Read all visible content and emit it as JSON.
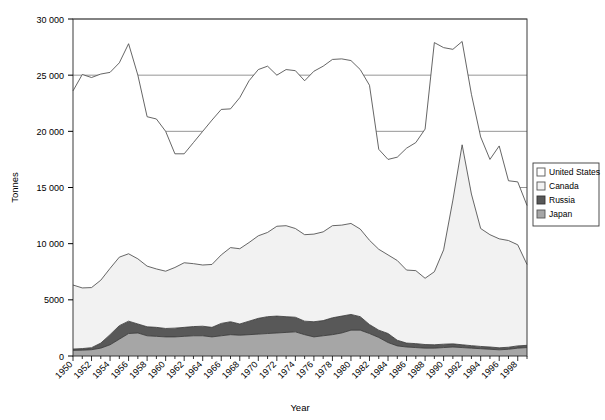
{
  "chart_data": {
    "type": "area",
    "title": "",
    "subtitle": "",
    "xlabel": "Year",
    "ylabel": "Tonnes",
    "stacked": true,
    "grid": true,
    "legend_position": "right",
    "xlim": [
      1950,
      1999
    ],
    "ylim": [
      0,
      30000
    ],
    "ytick_values": [
      0,
      5000,
      10000,
      15000,
      20000,
      25000,
      30000
    ],
    "ytick_labels": [
      "0",
      "5000",
      "10 000",
      "15 000",
      "20 000",
      "25 000",
      "30 000"
    ],
    "x": [
      1950,
      1951,
      1952,
      1953,
      1954,
      1955,
      1956,
      1957,
      1958,
      1959,
      1960,
      1961,
      1962,
      1963,
      1964,
      1965,
      1966,
      1967,
      1968,
      1969,
      1970,
      1971,
      1972,
      1973,
      1974,
      1975,
      1976,
      1977,
      1978,
      1979,
      1980,
      1981,
      1982,
      1983,
      1984,
      1985,
      1986,
      1987,
      1988,
      1989,
      1990,
      1991,
      1992,
      1993,
      1994,
      1995,
      1996,
      1997,
      1998,
      1999
    ],
    "xtick_labels": [
      "1950",
      "1952",
      "1954",
      "1956",
      "1958",
      "1960",
      "1962",
      "1964",
      "1966",
      "1968",
      "1970",
      "1972",
      "1974",
      "1976",
      "1978",
      "1980",
      "1982",
      "1984",
      "1986",
      "1988",
      "1990",
      "1992",
      "1994",
      "1996",
      "1998"
    ],
    "series": [
      {
        "name": "Japan",
        "color": "#a6a6a6",
        "values": [
          500,
          520,
          560,
          700,
          1000,
          1500,
          2000,
          2050,
          1800,
          1750,
          1700,
          1700,
          1750,
          1800,
          1800,
          1700,
          1800,
          1900,
          1850,
          1900,
          1950,
          2000,
          2050,
          2100,
          2150,
          1900,
          1700,
          1800,
          1900,
          2050,
          2300,
          2300,
          2000,
          1650,
          1200,
          900,
          800,
          750,
          700,
          700,
          750,
          800,
          750,
          700,
          650,
          600,
          550,
          600,
          700,
          750
        ]
      },
      {
        "name": "Russia",
        "color": "#585858",
        "values": [
          120,
          140,
          180,
          450,
          900,
          1200,
          1100,
          800,
          800,
          800,
          750,
          780,
          800,
          820,
          850,
          850,
          1100,
          1150,
          1000,
          1200,
          1400,
          1500,
          1500,
          1400,
          1300,
          1200,
          1350,
          1350,
          1500,
          1500,
          1400,
          1200,
          800,
          650,
          800,
          500,
          350,
          350,
          320,
          300,
          300,
          280,
          250,
          220,
          200,
          200,
          180,
          180,
          200,
          200
        ]
      },
      {
        "name": "Canada",
        "color": "#f2f2f2",
        "values": [
          5700,
          5400,
          5350,
          5600,
          5900,
          6100,
          6000,
          5800,
          5400,
          5200,
          5100,
          5400,
          5750,
          5600,
          5450,
          5600,
          6100,
          6600,
          6700,
          7000,
          7350,
          7500,
          8000,
          8100,
          7900,
          7700,
          7800,
          7900,
          8200,
          8100,
          8100,
          7800,
          7500,
          7200,
          7000,
          7100,
          6500,
          6500,
          5900,
          6500,
          8400,
          12800,
          17800,
          13500,
          10500,
          10000,
          9700,
          9500,
          9000,
          7200
        ]
      },
      {
        "name": "United States",
        "color": "#ffffff",
        "values": [
          17280,
          19000,
          18700,
          18350,
          17450,
          17300,
          18700,
          16350,
          13300,
          13350,
          12450,
          10120,
          9700,
          10780,
          11900,
          12850,
          12950,
          12350,
          13450,
          14400,
          14800,
          14800,
          13450,
          13900,
          14050,
          13700,
          14500,
          14750,
          14800,
          14800,
          14500,
          14200,
          13800,
          8900,
          8500,
          9200,
          10850,
          11400,
          13280,
          20400,
          18000,
          13420,
          9200,
          8880,
          8150,
          6700,
          8270,
          5320,
          5600,
          5250
        ]
      }
    ],
    "totals_note": "Stacked cumulative totals: United States top line ranges ~17500 to ~28400"
  },
  "legend": {
    "items": [
      {
        "label": "United States",
        "color": "#ffffff",
        "border": "#555555"
      },
      {
        "label": "Canada",
        "color": "#f2f2f2",
        "border": "#555555"
      },
      {
        "label": "Russia",
        "color": "#585858",
        "border": "#333333"
      },
      {
        "label": "Japan",
        "color": "#a6a6a6",
        "border": "#555555"
      }
    ]
  },
  "axes": {
    "y_title": "Tonnes",
    "x_title": "Year"
  }
}
